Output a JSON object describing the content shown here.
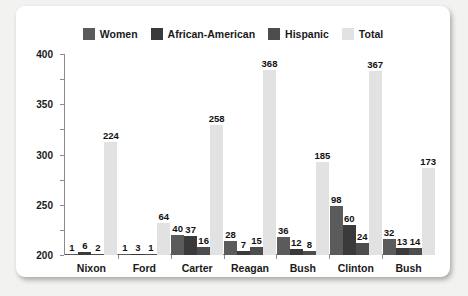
{
  "chart_data": {
    "type": "bar",
    "title": "",
    "xlabel": "",
    "ylabel": "",
    "ylim": [
      0,
      400
    ],
    "ytick_step": 50,
    "yticks": [
      "400",
      "350",
      "300",
      "250",
      "200",
      "150",
      "100",
      "50",
      "0"
    ],
    "grid": false,
    "legend_position": "top-center",
    "categories": [
      "Nixon",
      "Ford",
      "Carter",
      "Reagan",
      "Bush",
      "Clinton",
      "Bush"
    ],
    "series": [
      {
        "name": "Women",
        "color": "#5b5b5b",
        "values": [
          1,
          1,
          40,
          28,
          36,
          98,
          32
        ]
      },
      {
        "name": "African-American",
        "color": "#3a3a3a",
        "values": [
          6,
          3,
          37,
          7,
          12,
          60,
          13
        ]
      },
      {
        "name": "Hispanic",
        "color": "#4d4d4d",
        "values": [
          2,
          1,
          16,
          15,
          8,
          24,
          14
        ]
      },
      {
        "name": "Total",
        "color": "#e2e2e2",
        "values": [
          224,
          64,
          258,
          368,
          185,
          367,
          173
        ]
      }
    ]
  },
  "legend": {
    "items": [
      {
        "label": "Women"
      },
      {
        "label": "African-American"
      },
      {
        "label": "Hispanic"
      },
      {
        "label": "Total"
      }
    ]
  },
  "colors": {
    "women": "#5b5b5b",
    "african_american": "#3a3a3a",
    "hispanic": "#4d4d4d",
    "total": "#e2e2e2",
    "axis": "#8c8c8c",
    "text": "#1a1a1a",
    "card_background": "#ffffff",
    "page_background": "#f2f2f0"
  }
}
